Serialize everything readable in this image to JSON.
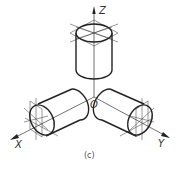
{
  "figure": {
    "caption": "(c)",
    "origin_label": "O",
    "axes": [
      {
        "name": "Z",
        "label": "Z",
        "direction": "up"
      },
      {
        "name": "X",
        "label": "X",
        "direction": "down-left"
      },
      {
        "name": "Y",
        "label": "Y",
        "direction": "down-right"
      }
    ],
    "line_color": "#222222",
    "background": "#ffffff"
  }
}
